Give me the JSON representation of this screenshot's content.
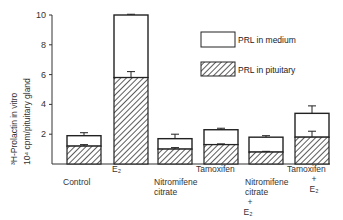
{
  "chart_data": {
    "type": "bar",
    "stacked": true,
    "title": "",
    "xlabel": "",
    "ylabel": "3H-Prolactin in vitro 10^4 cpm/pituitary gland",
    "ylabel_line1": "³H-Prolactin in vitro",
    "ylabel_line2": "10⁴ cpm/pituitary gland",
    "ylim": [
      0,
      10
    ],
    "yticks": [
      2,
      4,
      6,
      8,
      10
    ],
    "grid": false,
    "legend_position": "upper right",
    "categories": [
      "Control",
      "E2",
      "Nitromifene citrate",
      "Tamoxifen",
      "Nitromifene citrate + E2",
      "Tamoxifen + E2"
    ],
    "category_labels": [
      [
        "Control"
      ],
      [
        "E₂"
      ],
      [
        "Nitromifene",
        "citrate"
      ],
      [
        "Tamoxifen"
      ],
      [
        "Nitromifene",
        "citrate",
        "+",
        "E₂"
      ],
      [
        "Tamoxifen",
        "+",
        "E₂"
      ]
    ],
    "series": [
      {
        "name": "PRL in pituitary",
        "pattern": "hatched",
        "values": [
          1.2,
          5.8,
          1.0,
          1.3,
          0.8,
          1.8
        ],
        "errors": [
          0.1,
          0.4,
          0.1,
          0.05,
          0.05,
          0.4
        ]
      },
      {
        "name": "PRL in medium",
        "pattern": "white",
        "values": [
          0.7,
          4.2,
          0.7,
          1.0,
          1.0,
          1.6
        ],
        "errors": [
          0.2,
          0.05,
          0.3,
          0.1,
          0.1,
          0.5
        ]
      }
    ],
    "totals": [
      1.9,
      10.0,
      1.7,
      2.3,
      1.8,
      3.4
    ]
  },
  "legend": {
    "medium": "PRL in medium",
    "pituitary": "PRL in pituitary"
  },
  "colors": {
    "stroke": "#222222",
    "hatch": "#333333",
    "fill": "#ffffff"
  }
}
